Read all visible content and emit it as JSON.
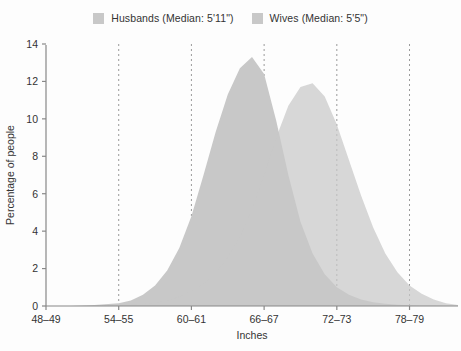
{
  "chart_data": {
    "type": "area",
    "title": "",
    "xlabel": "Inches",
    "ylabel": "Percentage of people",
    "xlim": [
      48,
      82
    ],
    "ylim": [
      0,
      14
    ],
    "yticks": [
      0,
      2,
      4,
      6,
      8,
      10,
      12,
      14
    ],
    "xticks": [
      48,
      54,
      60,
      66,
      72,
      78
    ],
    "xtick_labels": [
      "48–49",
      "54–55",
      "60–61",
      "66–67",
      "72–73",
      "78–79"
    ],
    "grid": "vertical-dashed",
    "legend_position": "top-center",
    "x": [
      48,
      50,
      52,
      54,
      55,
      56,
      57,
      58,
      59,
      60,
      61,
      62,
      63,
      64,
      65,
      66,
      67,
      68,
      69,
      70,
      71,
      72,
      73,
      74,
      75,
      76,
      77,
      78,
      79,
      80,
      81,
      82
    ],
    "series": [
      {
        "name": "Wives (Median: 5'5\")",
        "color": "#c8c8c8",
        "values": [
          0,
          0,
          0.05,
          0.15,
          0.3,
          0.6,
          1.1,
          1.9,
          3.1,
          4.8,
          7.0,
          9.3,
          11.3,
          12.7,
          13.3,
          12.4,
          9.9,
          7.0,
          4.5,
          2.8,
          1.7,
          1.0,
          0.6,
          0.35,
          0.2,
          0.12,
          0.07,
          0.04,
          0.02,
          0.01,
          0,
          0
        ]
      },
      {
        "name": "Husbands (Median: 5'11\")",
        "color": "#c8c8c8",
        "values": [
          0,
          0,
          0,
          0.02,
          0.05,
          0.1,
          0.18,
          0.3,
          0.5,
          0.8,
          1.2,
          1.8,
          2.6,
          3.7,
          5.2,
          7.0,
          9.0,
          10.7,
          11.7,
          11.9,
          11.2,
          9.7,
          7.8,
          5.9,
          4.2,
          2.8,
          1.8,
          1.1,
          0.65,
          0.35,
          0.15,
          0.05
        ]
      }
    ],
    "overlap_color": "#a8a8a8",
    "axis_color": "#888888",
    "gridline_color": "#9a9a9a",
    "text_color": "#333333",
    "background_color": "#fdfdfd"
  },
  "legend": {
    "entries": [
      {
        "label": "Husbands (Median: 5'11\")",
        "color": "#c8c8c8"
      },
      {
        "label": "Wives (Median: 5'5\")",
        "color": "#c8c8c8"
      }
    ]
  }
}
